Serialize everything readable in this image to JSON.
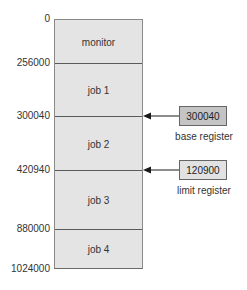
{
  "diagram": {
    "type": "memory-layout-base-limit-registers",
    "memory": {
      "segments": [
        {
          "label": "monitor",
          "start": "0",
          "end": "256000"
        },
        {
          "label": "job 1",
          "start": "256000",
          "end": "300040"
        },
        {
          "label": "job 2",
          "start": "300040",
          "end": "420940"
        },
        {
          "label": "job 3",
          "start": "420940",
          "end": "880000"
        },
        {
          "label": "job 4",
          "start": "880000",
          "end": "1024000"
        }
      ],
      "addresses": [
        "0",
        "256000",
        "300040",
        "420940",
        "880000",
        "1024000"
      ]
    },
    "registers": {
      "base": {
        "value": "300040",
        "label": "base register",
        "points_to": "300040",
        "color": "#c4c4c4"
      },
      "limit": {
        "value": "120900",
        "label": "limit register",
        "points_to": "420940",
        "color": "#e2e2e2"
      }
    },
    "colors": {
      "memory_fill": "#e4e4e4",
      "divider": "#5a5a5a",
      "arrow": "#1a1a1a"
    }
  }
}
